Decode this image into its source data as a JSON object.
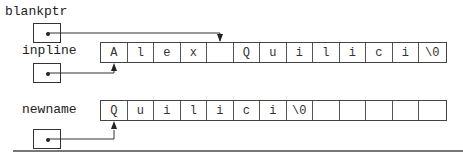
{
  "diagram": {
    "variables": {
      "blankptr": {
        "label": "blankptr"
      },
      "inpline": {
        "label": "inpline"
      },
      "newname": {
        "label": "newname"
      }
    },
    "arrays": {
      "inpline": {
        "cells": [
          "A",
          "l",
          "e",
          "x",
          "",
          "Q",
          "u",
          "i",
          "l",
          "i",
          "c",
          "i",
          "\\0"
        ]
      },
      "newname": {
        "cells": [
          "Q",
          "u",
          "i",
          "l",
          "i",
          "c",
          "i",
          "\\0",
          "",
          "",
          "",
          "",
          ""
        ]
      }
    },
    "pointers": [
      {
        "from": "blankptr",
        "to": "inpline[4]"
      },
      {
        "from": "inpline",
        "to": "inpline[0]"
      },
      {
        "from": "newname",
        "to": "newname[0]"
      }
    ]
  }
}
